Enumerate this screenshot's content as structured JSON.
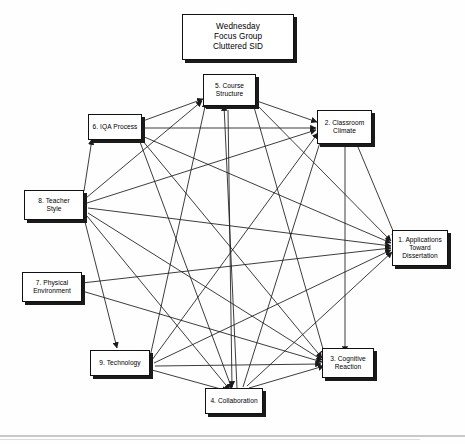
{
  "diagram": {
    "title_box": {
      "id": "title",
      "name": "title-box",
      "lines": [
        "Wednesday",
        "Focus Group",
        "Cluttered SID"
      ],
      "text": "Wednesday\nFocus Group\nCluttered SID"
    },
    "style": {
      "background_color": "#ffffff",
      "box_fill": "#ffffff",
      "box_border_color": "#111111",
      "box_shadow_color": "#1a1a1a",
      "line_color": "#1a1a1a",
      "text_color": "#000000"
    },
    "nodes": [
      {
        "id": "5",
        "name": "node-course-structure",
        "label": "5. Course\nStructure",
        "lines": [
          "5. Course",
          "Structure"
        ]
      },
      {
        "id": "2",
        "name": "node-classroom-climate",
        "label": "2. Classroom\nClimate",
        "lines": [
          "2. Classroom",
          "Climate"
        ]
      },
      {
        "id": "6",
        "name": "node-iqa-process",
        "label": "6. IQA Process",
        "lines": [
          "6. IQA Process"
        ]
      },
      {
        "id": "8",
        "name": "node-teacher-style",
        "label": "8. Teacher\nStyle",
        "lines": [
          "8. Teacher",
          "Style"
        ]
      },
      {
        "id": "1",
        "name": "node-applications-toward-dissertation",
        "label": "1. Applications\nToward\nDissertation",
        "lines": [
          "1. Applications",
          "Toward",
          "Dissertation"
        ]
      },
      {
        "id": "7",
        "name": "node-physical-environment",
        "label": "7. Physical\nEnvironment",
        "lines": [
          "7. Physical",
          "Environment"
        ]
      },
      {
        "id": "9",
        "name": "node-technology",
        "label": "9. Technology",
        "lines": [
          "9. Technology"
        ]
      },
      {
        "id": "3",
        "name": "node-cognitive-reaction",
        "label": "3. Cognitive\nReaction",
        "lines": [
          "3. Cognitive",
          "Reaction"
        ]
      },
      {
        "id": "4",
        "name": "node-collaboration",
        "label": "4. Collaboration",
        "lines": [
          "4. Collaboration"
        ]
      }
    ],
    "edges": [
      {
        "from": "6",
        "to": "5"
      },
      {
        "from": "6",
        "to": "2"
      },
      {
        "from": "6",
        "to": "1"
      },
      {
        "from": "6",
        "to": "3"
      },
      {
        "from": "6",
        "to": "4"
      },
      {
        "from": "8",
        "to": "6"
      },
      {
        "from": "8",
        "to": "5"
      },
      {
        "from": "8",
        "to": "2"
      },
      {
        "from": "8",
        "to": "1"
      },
      {
        "from": "8",
        "to": "3"
      },
      {
        "from": "8",
        "to": "4"
      },
      {
        "from": "8",
        "to": "9"
      },
      {
        "from": "7",
        "to": "1"
      },
      {
        "from": "7",
        "to": "3"
      },
      {
        "from": "9",
        "to": "5"
      },
      {
        "from": "9",
        "to": "2"
      },
      {
        "from": "9",
        "to": "1"
      },
      {
        "from": "9",
        "to": "3"
      },
      {
        "from": "9",
        "to": "4"
      },
      {
        "from": "4",
        "to": "5"
      },
      {
        "from": "4",
        "to": "2"
      },
      {
        "from": "4",
        "to": "1"
      },
      {
        "from": "4",
        "to": "3"
      },
      {
        "from": "5",
        "to": "2"
      },
      {
        "from": "5",
        "to": "1"
      },
      {
        "from": "5",
        "to": "3"
      },
      {
        "from": "5",
        "to": "4"
      },
      {
        "from": "2",
        "to": "1"
      },
      {
        "from": "2",
        "to": "3"
      }
    ]
  }
}
